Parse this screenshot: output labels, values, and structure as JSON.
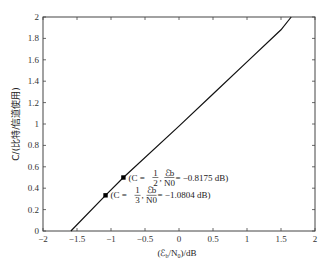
{
  "chart_data": {
    "type": "line",
    "title": "",
    "xlabel": "(ℰb/N0)/dB",
    "ylabel": "C/(比特/信道使用)",
    "xlim": [
      -2,
      2
    ],
    "ylim": [
      0,
      2
    ],
    "xticks": [
      -2,
      -1.5,
      -1,
      -0.5,
      0,
      0.5,
      1,
      1.5,
      2
    ],
    "xtick_labels": [
      "−2",
      "−1.5",
      "−1",
      "−0.5",
      "0",
      "0.5",
      "1",
      "1.5",
      "2"
    ],
    "yticks": [
      0,
      0.2,
      0.4,
      0.6,
      0.8,
      1,
      1.2,
      1.4,
      1.6,
      1.8,
      2
    ],
    "ytick_labels": [
      "0",
      "0.2",
      "0.4",
      "0.6",
      "0.8",
      "1",
      "1.2",
      "1.4",
      "1.6",
      "1.8",
      "2"
    ],
    "grid": false,
    "legend": null,
    "series": [
      {
        "name": "capacity curve",
        "x": [
          -1.59,
          -1.0804,
          -0.8175,
          0,
          0.5,
          1.0,
          1.5,
          1.65
        ],
        "y": [
          0.0,
          0.333,
          0.5,
          0.98,
          1.28,
          1.58,
          1.88,
          2.0
        ]
      }
    ],
    "points": [
      {
        "x": -0.8175,
        "y": 0.5,
        "label_prefix": "(C = ",
        "frac_num": "1",
        "frac_den": "2",
        "label_mid": ", ",
        "ratio_num": "ℰb",
        "ratio_den": "N0",
        "label_suffix": " = −0.8175 dB)"
      },
      {
        "x": -1.0804,
        "y": 0.3333,
        "label_prefix": "(C = ",
        "frac_num": "1",
        "frac_den": "3",
        "label_mid": ", ",
        "ratio_num": "ℰb",
        "ratio_den": "N0",
        "label_suffix": " = −1.0804 dB)"
      }
    ]
  },
  "labels": {
    "xlabel_main": "(ℰ",
    "xlabel_sub": "b",
    "xlabel_mid": "/N",
    "xlabel_sub2": "0",
    "xlabel_end": ")/dB",
    "ylabel": "C/(比特/信道使用)"
  }
}
